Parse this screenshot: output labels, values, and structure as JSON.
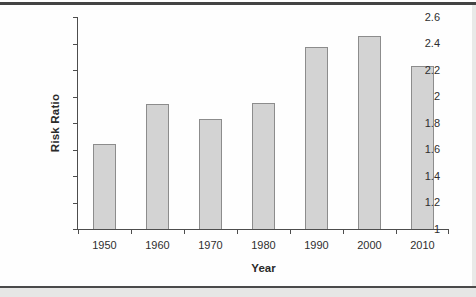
{
  "figure": {
    "background": "#fefefe",
    "top_rule_color": "#434343",
    "bottom_rule_color": "#4a4a4a",
    "outer_margin_color": "#e6e6e5"
  },
  "chart_data": {
    "type": "bar",
    "title": "",
    "xlabel": "Year",
    "ylabel": "Risk Ratio",
    "categories": [
      "1950",
      "1960",
      "1970",
      "1980",
      "1990",
      "2000",
      "2010"
    ],
    "values": [
      1.64,
      1.94,
      1.83,
      1.95,
      2.37,
      2.46,
      2.23
    ],
    "ylim": [
      1,
      2.6
    ],
    "ytick_step": 0.2,
    "ytick_labels": [
      "2.6",
      "2.4",
      "2.2",
      "2",
      "1.8",
      "1.6",
      "1.4",
      "1.2",
      "1"
    ],
    "grid": false,
    "legend": null,
    "bar_fill": "#d3d3d3",
    "bar_border": "#8c8c8c",
    "axis_color": "#4d4d4d",
    "text_color": "#2e2e2e"
  }
}
